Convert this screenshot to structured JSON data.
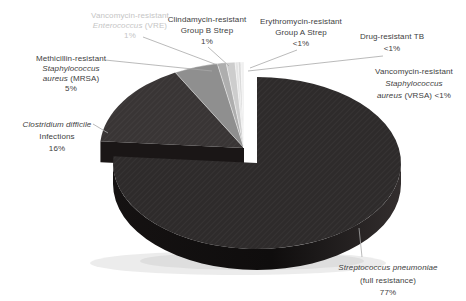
{
  "chart_data": {
    "type": "pie",
    "style": "3d-exploded-pie",
    "title": "",
    "background": "#ffffff",
    "legend": "none",
    "leader_color": "#a8a8a8",
    "geometry": {
      "cx": 244,
      "cy": 148,
      "rx": 144,
      "ry": 86,
      "depth": 21,
      "explode_dx": 13,
      "explode_dy": 15,
      "group_side_color": "#1a1616",
      "big_side_dark": "#151212",
      "big_side_mid": "#0f0d0d",
      "big_side_light": "#332e2e"
    },
    "slices": [
      {
        "id": "strep-pneumoniae",
        "name": "Streptococcus pneumoniae (full resistance)",
        "value_label": "77%",
        "weight": 77,
        "color": "#2e2b2b",
        "exploded": true,
        "textured": true,
        "label": {
          "x": 388,
          "y": 269,
          "line_height": 12.5,
          "color": "#3e3e3e",
          "lines": [
            [
              {
                "text": "Streptococcus pneumoniae",
                "italic": true
              }
            ],
            [
              {
                "text": "(full resistance)"
              }
            ],
            [
              {
                "text": "77%"
              }
            ]
          ]
        },
        "leader": [
          359,
          228,
          362,
          257
        ]
      },
      {
        "id": "c-difficile",
        "name": "Clostridium difficile Infections",
        "value_label": "16%",
        "weight": 16,
        "color": "#393535",
        "textured": true,
        "label": {
          "x": 57,
          "y": 126,
          "line_height": 12,
          "color": "#3e3e3e",
          "lines": [
            [
              {
                "text": "Clostridium difficile",
                "italic": true
              }
            ],
            [
              {
                "text": "Infections"
              }
            ],
            [
              {
                "text": "16%"
              }
            ]
          ]
        },
        "leader": [
          93,
          124,
          108,
          133
        ]
      },
      {
        "id": "mrsa",
        "name": "Methicillin-resistant Staphylococcus aureus (MRSA)",
        "value_label": "5%",
        "weight": 5,
        "color": "#8f8f8f",
        "label": {
          "x": 71,
          "y": 59,
          "line_height": 10,
          "color": "#3e3e3e",
          "lines": [
            [
              {
                "text": "Methicillin-resistant"
              }
            ],
            [
              {
                "text": "Staphylococcus",
                "italic": true
              }
            ],
            [
              {
                "text": "aureus",
                "italic": true
              },
              {
                "text": " (MRSA)"
              }
            ],
            [
              {
                "text": "5%"
              }
            ]
          ]
        },
        "leader": [
          105,
          60,
          212,
          71
        ]
      },
      {
        "id": "vre",
        "name": "Vancomycin-resistant Enterococcus (VRE)",
        "value_label": "1%",
        "weight": 1,
        "color": "#aeaeae",
        "label": {
          "x": 130,
          "y": 16,
          "line_height": 10,
          "color": "#c5c5c5",
          "lines": [
            [
              {
                "text": "Vancomycin-resistant"
              }
            ],
            [
              {
                "text": "Enterococcus",
                "italic": true
              },
              {
                "text": " (VRE)"
              }
            ],
            [
              {
                "text": "1%"
              }
            ]
          ]
        },
        "leader": [
          143,
          37,
          220,
          66
        ]
      },
      {
        "id": "group-b-strep",
        "name": "Clindamycin-resistant Group B Strep",
        "value_label": "1%",
        "weight": 1,
        "color": "#cdcdcd",
        "label": {
          "x": 207,
          "y": 20,
          "line_height": 11,
          "color": "#3e3e3e",
          "lines": [
            [
              {
                "text": "Clindamycin-resistant"
              }
            ],
            [
              {
                "text": "Group B Strep"
              }
            ],
            [
              {
                "text": "1%"
              }
            ]
          ]
        },
        "leader": [
          208,
          47,
          229,
          66
        ]
      },
      {
        "id": "group-a-strep",
        "name": "Erythromycin-resistant Group A Strep",
        "value_label": "<1%",
        "weight": 0.35,
        "color": "#e4e4e4",
        "label": {
          "x": 301,
          "y": 22,
          "line_height": 11,
          "color": "#3e3e3e",
          "lines": [
            [
              {
                "text": "Erythromycin-resistant"
              }
            ],
            [
              {
                "text": "Group A Strep"
              }
            ],
            [
              {
                "text": "<1%"
              }
            ]
          ]
        },
        "leader": [
          297,
          50,
          250,
          68
        ]
      },
      {
        "id": "drug-resistant-tb",
        "name": "Drug-resistant TB",
        "value_label": "<1%",
        "weight": 0.3,
        "color": "#d9d9d9",
        "label": {
          "x": 392,
          "y": 38,
          "line_height": 12,
          "color": "#3e3e3e",
          "lines": [
            [
              {
                "text": "Drug-resistant TB"
              }
            ],
            [
              {
                "text": "<1%"
              }
            ]
          ]
        },
        "leader": [
          383,
          56,
          248,
          71
        ]
      },
      {
        "id": "vrsa",
        "name": "Vancomycin-resistant Staphylococcus aureus (VRSA)",
        "value_label": "<1%",
        "weight": 0.35,
        "color": "#f0f0f0",
        "label": {
          "x": 414,
          "y": 73,
          "line_height": 12,
          "color": "#3e3e3e",
          "lines": [
            [
              {
                "text": "Vancomycin-resistant"
              }
            ],
            [
              {
                "text": "Staphylococcus",
                "italic": true
              }
            ],
            [
              {
                "text": "aureus",
                "italic": true
              },
              {
                "text": " (VRSA) <1%"
              }
            ]
          ]
        }
      }
    ]
  }
}
